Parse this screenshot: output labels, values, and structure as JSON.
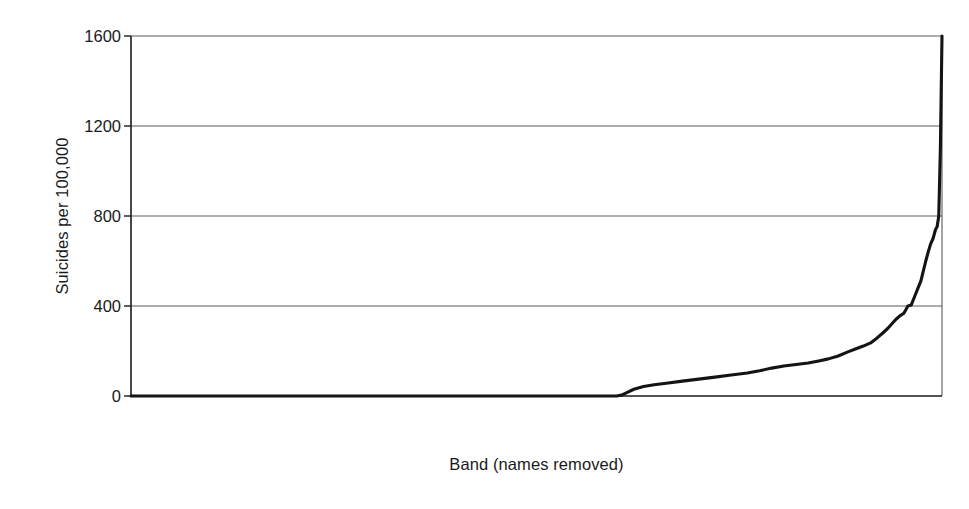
{
  "chart_data": {
    "type": "line",
    "title": "",
    "xlabel": "Band (names removed)",
    "ylabel": "Suicides per 100,000",
    "ylim": [
      0,
      1600
    ],
    "yticks": [
      0,
      400,
      800,
      1200,
      1600
    ],
    "ytick_labels": [
      "0",
      "400",
      "800",
      "1200",
      "1600"
    ],
    "xlim": [
      0,
      1
    ],
    "xticks": [],
    "xtick_labels": [],
    "grid": "horizontal",
    "legend": "none",
    "line_color": "#1a1a1a",
    "background_color": "#ffffff",
    "series": [
      {
        "name": "Suicides per 100,000 by band (rank ordered)",
        "x": [
          0.0,
          0.1,
          0.2,
          0.3,
          0.4,
          0.5,
          0.56,
          0.59,
          0.599,
          0.605,
          0.612,
          0.62,
          0.632,
          0.645,
          0.66,
          0.68,
          0.7,
          0.72,
          0.74,
          0.76,
          0.775,
          0.79,
          0.805,
          0.82,
          0.835,
          0.848,
          0.86,
          0.872,
          0.884,
          0.894,
          0.903,
          0.912,
          0.92,
          0.927,
          0.933,
          0.938,
          0.943,
          0.948,
          0.953,
          0.958,
          0.962,
          0.966,
          0.97,
          0.974,
          0.977,
          0.98,
          0.983,
          0.986,
          0.989,
          0.992,
          0.994,
          0.996,
          0.998,
          1.0
        ],
        "y": [
          0,
          0,
          0,
          0,
          0,
          0,
          0,
          0,
          0,
          4,
          16,
          30,
          42,
          50,
          57,
          66,
          75,
          84,
          93,
          102,
          112,
          124,
          133,
          140,
          147,
          156,
          165,
          178,
          196,
          210,
          222,
          236,
          258,
          280,
          300,
          320,
          340,
          356,
          368,
          400,
          404,
          440,
          476,
          512,
          556,
          600,
          640,
          676,
          700,
          740,
          752,
          800,
          1100,
          1600
        ]
      }
    ]
  },
  "axes": {
    "ytick_labels": [
      "1600",
      "1200",
      "800",
      "400",
      "0"
    ]
  }
}
